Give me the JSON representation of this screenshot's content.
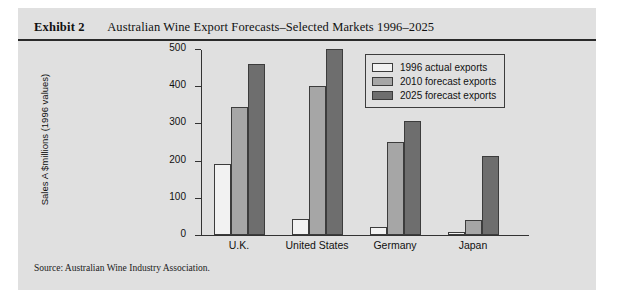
{
  "exhibit": {
    "label": "Exhibit 2",
    "title": "Australian Wine Export Forecasts–Selected Markets 1996–2025",
    "source": "Source: Australian Wine Industry Association."
  },
  "colors": {
    "panel_background": "#e0e0e0",
    "rule": "#2a2a2a",
    "series_1996": "#f2f2f2",
    "series_2010": "#a6a6a6",
    "series_2025": "#6e6e6e",
    "axis": "#333333"
  },
  "chart_data": {
    "type": "bar",
    "title": "",
    "xlabel": "",
    "ylabel": "Sales A $millions (1996 values)",
    "ylim": [
      0,
      500
    ],
    "yticks": [
      0,
      100,
      200,
      300,
      400,
      500
    ],
    "ytick_labels": [
      "0",
      "100",
      "200",
      "300",
      "400",
      "500"
    ],
    "grid": false,
    "legend_position": "top-right",
    "categories": [
      "U.K.",
      "United States",
      "Germany",
      "Japan"
    ],
    "series": [
      {
        "name": "1996 actual exports",
        "values": [
          190,
          42,
          22,
          8
        ]
      },
      {
        "name": "2010 forecast exports",
        "values": [
          343,
          400,
          250,
          40
        ]
      },
      {
        "name": "2025 forecast exports",
        "values": [
          460,
          500,
          307,
          213
        ]
      }
    ]
  }
}
